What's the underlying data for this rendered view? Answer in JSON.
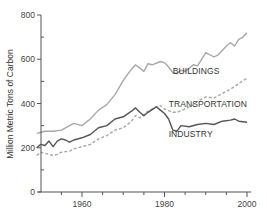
{
  "chart_data": {
    "type": "line",
    "title": "",
    "xlabel": "",
    "ylabel": "Million Metric Tons of Carbon",
    "xlim": [
      1949,
      2001
    ],
    "ylim": [
      0,
      800
    ],
    "x_ticks": [
      1960,
      1980,
      2000
    ],
    "x_minor_ticks": [
      1955,
      1960,
      1965,
      1970,
      1975,
      1980,
      1985,
      1990,
      1995,
      2000
    ],
    "y_ticks": [
      0,
      200,
      400,
      600,
      800
    ],
    "grid": false,
    "legend": "inline labels",
    "series": [
      {
        "name": "BUILDINGS",
        "style": "solid",
        "color": "#a8a8a8",
        "x": [
          1949,
          1951,
          1953,
          1955,
          1957,
          1958,
          1960,
          1962,
          1964,
          1966,
          1968,
          1970,
          1972,
          1973,
          1974,
          1975,
          1976,
          1977,
          1979,
          1980,
          1981,
          1982,
          1983,
          1984,
          1985,
          1986,
          1987,
          1988,
          1989,
          1990,
          1992,
          1993,
          1994,
          1995,
          1996,
          1997,
          1998,
          1999,
          2000
        ],
        "y": [
          265,
          275,
          275,
          280,
          300,
          310,
          300,
          330,
          370,
          395,
          440,
          505,
          555,
          575,
          560,
          545,
          580,
          575,
          590,
          585,
          565,
          540,
          535,
          550,
          545,
          560,
          575,
          570,
          600,
          630,
          610,
          620,
          640,
          660,
          675,
          660,
          690,
          700,
          720
        ]
      },
      {
        "name": "TRANSPORTATION",
        "style": "dashed",
        "color": "#a8a8a8",
        "x": [
          1949,
          1950,
          1951,
          1952,
          1953,
          1954,
          1955,
          1957,
          1958,
          1960,
          1962,
          1964,
          1966,
          1968,
          1970,
          1972,
          1973,
          1974,
          1976,
          1978,
          1979,
          1980,
          1982,
          1983,
          1985,
          1987,
          1988,
          1990,
          1992,
          1994,
          1996,
          1998,
          2000
        ],
        "y": [
          165,
          180,
          175,
          170,
          165,
          170,
          180,
          185,
          195,
          205,
          215,
          240,
          255,
          280,
          290,
          320,
          345,
          335,
          365,
          385,
          390,
          375,
          360,
          360,
          375,
          395,
          410,
          430,
          425,
          445,
          465,
          490,
          515
        ]
      },
      {
        "name": "INDUSTRY",
        "style": "solid",
        "color": "#555555",
        "x": [
          1949,
          1950,
          1951,
          1952,
          1953,
          1954,
          1955,
          1956,
          1957,
          1958,
          1960,
          1962,
          1964,
          1966,
          1968,
          1970,
          1972,
          1973,
          1974,
          1975,
          1976,
          1978,
          1979,
          1980,
          1981,
          1982,
          1983,
          1984,
          1986,
          1988,
          1990,
          1992,
          1994,
          1996,
          1997,
          1998,
          2000
        ],
        "y": [
          200,
          215,
          210,
          230,
          205,
          230,
          240,
          235,
          225,
          235,
          245,
          260,
          290,
          300,
          330,
          340,
          365,
          380,
          360,
          345,
          360,
          385,
          370,
          355,
          330,
          280,
          275,
          300,
          295,
          305,
          310,
          305,
          320,
          325,
          330,
          320,
          315
        ]
      }
    ],
    "annotations": [
      {
        "text": "BUILDINGS",
        "x": 1982,
        "y": 535
      },
      {
        "text": "TRANSPORTATION",
        "x": 1981,
        "y": 385
      },
      {
        "text": "INDUSTRY",
        "x": 1981,
        "y": 250
      }
    ]
  },
  "axis": {
    "y_tick_labels": [
      "0",
      "200",
      "400",
      "600",
      "800"
    ],
    "x_tick_labels": [
      "1960",
      "1980",
      "2000"
    ]
  }
}
